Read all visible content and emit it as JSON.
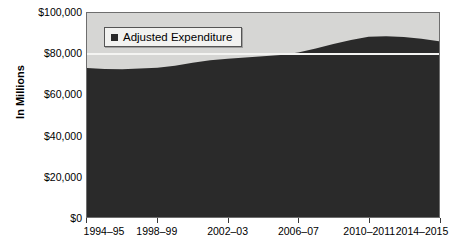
{
  "chart_data": {
    "type": "area",
    "title": "",
    "xlabel": "",
    "ylabel": "In Millions",
    "ylim": [
      0,
      100000
    ],
    "ytick_labels": [
      "$100,000",
      "$80,000",
      "$60,000",
      "$40,000",
      "$20,000",
      "$0"
    ],
    "ytick_values": [
      100000,
      80000,
      60000,
      40000,
      20000,
      0
    ],
    "grid": true,
    "gridline_values": [
      80000
    ],
    "legend_position": "top-left",
    "legend": [
      "Adjusted Expenditure"
    ],
    "xtick_labels": [
      "1994–95",
      "1998–99",
      "2002–03",
      "2006–07",
      "2010–2011",
      "2014–2015"
    ],
    "xtick_values": [
      0,
      4,
      8,
      12,
      16,
      20
    ],
    "categories": [
      "1994–95",
      "1995–96",
      "1996–97",
      "1997–98",
      "1998–99",
      "1999–2000",
      "2000–01",
      "2001–02",
      "2002–03",
      "2003–04",
      "2004–05",
      "2005–06",
      "2006–07",
      "2007–08",
      "2008–09",
      "2009–2010",
      "2010–2011",
      "2011–2012",
      "2012–2013",
      "2013–2014",
      "2014–2015"
    ],
    "series": [
      {
        "name": "Adjusted Expenditure",
        "color": "#2a2a2a",
        "values": [
          73000,
          72600,
          72400,
          72800,
          73200,
          74200,
          75600,
          76800,
          77600,
          78200,
          78800,
          79400,
          80600,
          82600,
          84800,
          86800,
          88400,
          88600,
          88200,
          87400,
          86200
        ]
      }
    ],
    "plot_background_color": "#d6d6d4",
    "gridline_color": "#f4f4f2",
    "axis_color": "#6e6e6e"
  },
  "legend": {
    "entries": [
      {
        "label": "Adjusted Expenditure",
        "swatch_icon": "filled-square-icon"
      }
    ]
  },
  "axes": {
    "y_title": "In Millions"
  }
}
